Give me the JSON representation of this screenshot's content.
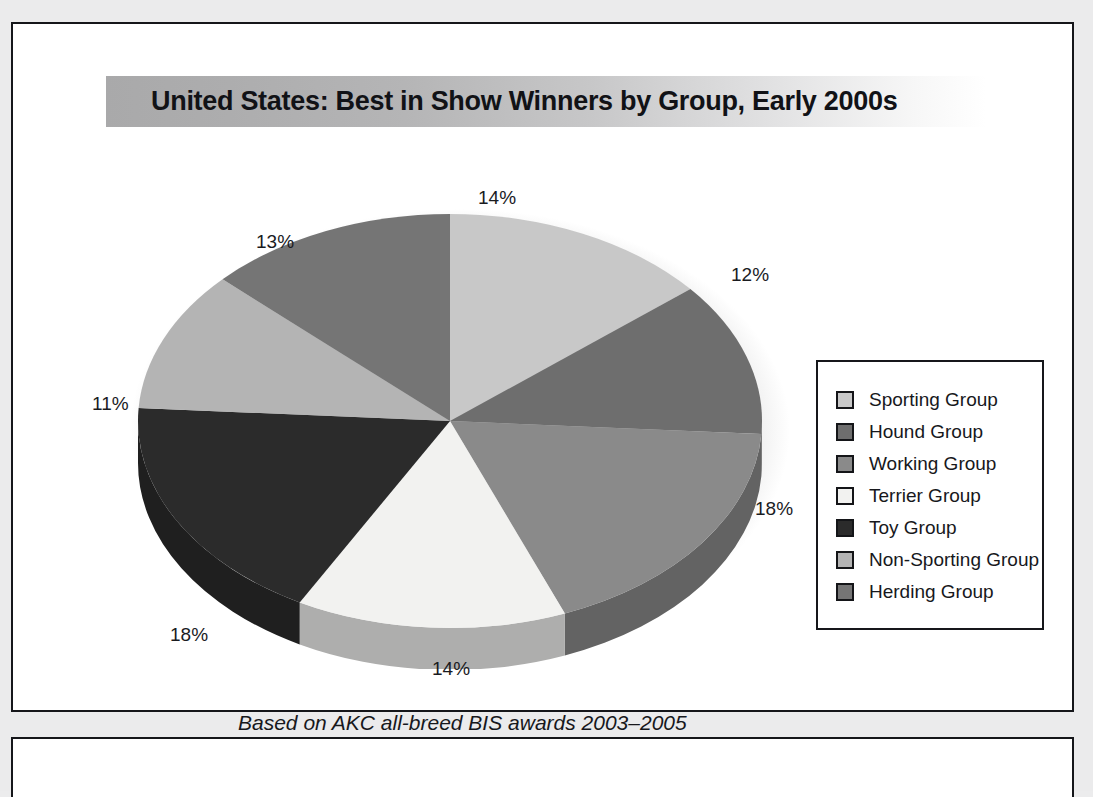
{
  "figure": {
    "title": "United States: Best in Show Winners by Group, Early 2000s",
    "caption": "Based on AKC all-breed BIS awards 2003–2005"
  },
  "chart_data": {
    "type": "pie",
    "title": "United States: Best in Show Winners by Group, Early 2000s",
    "subtitle": "Based on AKC all-breed BIS awards 2003–2005",
    "xlabel": "",
    "ylabel": "",
    "legend_position": "right",
    "grid": false,
    "three_d": true,
    "categories": [
      "Sporting Group",
      "Hound Group",
      "Working Group",
      "Terrier Group",
      "Toy Group",
      "Non-Sporting Group",
      "Herding Group"
    ],
    "values": [
      14,
      12,
      18,
      14,
      18,
      11,
      13
    ],
    "labels": [
      "14%",
      "12%",
      "18%",
      "14%",
      "18%",
      "11%",
      "13%"
    ],
    "colors": [
      "#c8c8c8",
      "#6e6e6e",
      "#8a8a8a",
      "#f2f2f0",
      "#2b2b2b",
      "#b4b4b4",
      "#757575"
    ]
  },
  "legend": {
    "items": [
      {
        "label": "Sporting Group",
        "color": "#c8c8c8"
      },
      {
        "label": "Hound Group",
        "color": "#6e6e6e"
      },
      {
        "label": "Working Group",
        "color": "#8a8a8a"
      },
      {
        "label": "Terrier Group",
        "color": "#f2f2f0"
      },
      {
        "label": "Toy Group",
        "color": "#2b2b2b"
      },
      {
        "label": "Non-Sporting Group",
        "color": "#b4b4b4"
      },
      {
        "label": "Herding Group",
        "color": "#757575"
      }
    ]
  },
  "percent_labels": [
    {
      "text": "14%",
      "name": "pct-label-sporting",
      "left": 465,
      "top": 163
    },
    {
      "text": "12%",
      "name": "pct-label-hound",
      "left": 718,
      "top": 240
    },
    {
      "text": "18%",
      "name": "pct-label-working",
      "left": 742,
      "top": 474
    },
    {
      "text": "14%",
      "name": "pct-label-terrier",
      "left": 419,
      "top": 634
    },
    {
      "text": "18%",
      "name": "pct-label-toy",
      "left": 157,
      "top": 600
    },
    {
      "text": "11%",
      "name": "pct-label-nonsporting",
      "left": 79,
      "top": 369
    },
    {
      "text": "13%",
      "name": "pct-label-herding",
      "left": 243,
      "top": 207
    }
  ]
}
